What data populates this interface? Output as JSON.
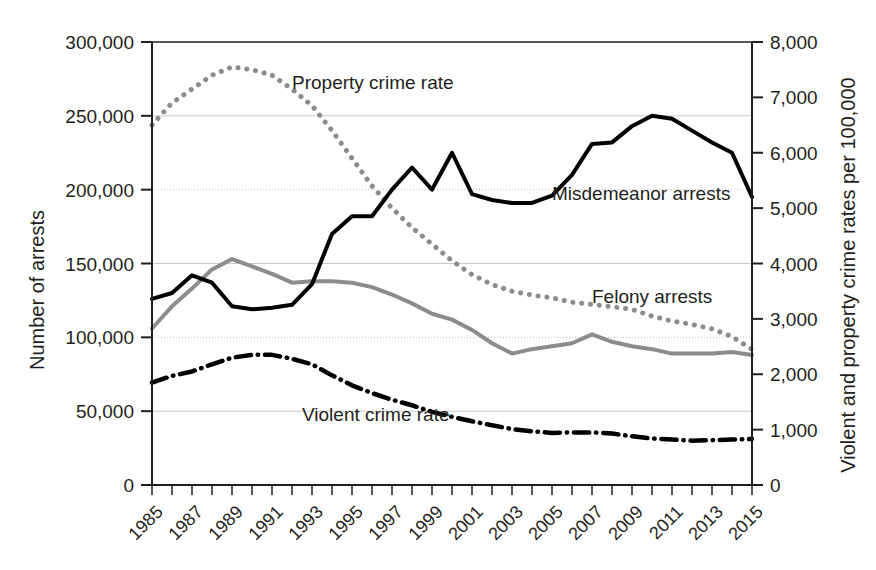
{
  "chart_data": {
    "type": "line",
    "title": "",
    "xlabel": "",
    "ylabel": "Number of arrests",
    "y2label": "Violent and property crime rates per 100,000",
    "grid": "horizontal-dotted",
    "legend": "inline-annotations",
    "x": [
      1985,
      1986,
      1987,
      1988,
      1989,
      1990,
      1991,
      1992,
      1993,
      1994,
      1995,
      1996,
      1997,
      1998,
      1999,
      2000,
      2001,
      2002,
      2003,
      2004,
      2005,
      2006,
      2007,
      2008,
      2009,
      2010,
      2011,
      2012,
      2013,
      2014,
      2015
    ],
    "xtick_labels": [
      "1985",
      "1987",
      "1989",
      "1991",
      "1993",
      "1995",
      "1997",
      "1999",
      "2001",
      "2003",
      "2005",
      "2007",
      "2009",
      "2011",
      "2013",
      "2015"
    ],
    "xtick_values": [
      1985,
      1987,
      1989,
      1991,
      1993,
      1995,
      1997,
      1999,
      2001,
      2003,
      2005,
      2007,
      2009,
      2011,
      2013,
      2015
    ],
    "xlim": [
      1985,
      2015
    ],
    "ytick_labels": [
      "0",
      "50,000",
      "100,000",
      "150,000",
      "200,000",
      "250,000",
      "300,000"
    ],
    "ytick_values": [
      0,
      50000,
      100000,
      150000,
      200000,
      250000,
      300000
    ],
    "ylim": [
      0,
      300000
    ],
    "y2tick_labels": [
      "0",
      "1,000",
      "2,000",
      "3,000",
      "4,000",
      "5,000",
      "6,000",
      "7,000",
      "8,000"
    ],
    "y2tick_values": [
      0,
      1000,
      2000,
      3000,
      4000,
      5000,
      6000,
      7000,
      8000
    ],
    "y2lim": [
      0,
      8000
    ],
    "series": [
      {
        "name": "Misdemeanor arrests",
        "axis": "left",
        "style": "solid",
        "color": "#000000",
        "width": 4,
        "label_x": 2005.0,
        "label_y": 193000,
        "values": [
          126000,
          130000,
          142000,
          137000,
          121000,
          119000,
          120000,
          122000,
          136000,
          170000,
          182000,
          182000,
          200000,
          215000,
          200000,
          225000,
          197000,
          193000,
          191000,
          191000,
          196000,
          210000,
          231000,
          232000,
          243000,
          250000,
          248000,
          240000,
          232000,
          225000,
          195000
        ]
      },
      {
        "name": "Felony arrests",
        "axis": "left",
        "style": "solid",
        "color": "#8c8c8c",
        "width": 4,
        "label_x": 2007.0,
        "label_y": 123000,
        "values": [
          106000,
          121000,
          133000,
          146000,
          153000,
          148000,
          143000,
          137000,
          138000,
          138000,
          137000,
          134000,
          129000,
          123000,
          116000,
          112000,
          105000,
          96000,
          89000,
          92000,
          94000,
          96000,
          102000,
          97000,
          94000,
          92000,
          89000,
          89000,
          89000,
          90000,
          88000
        ]
      },
      {
        "name": "Property crime rate",
        "axis": "right",
        "style": "dotted",
        "color": "#8c8c8c",
        "width": 5,
        "label_x": 1992.0,
        "label_y_right": 7150,
        "values": [
          6500,
          6900,
          7150,
          7400,
          7550,
          7500,
          7400,
          7150,
          6850,
          6400,
          5900,
          5400,
          5000,
          4650,
          4350,
          4050,
          3800,
          3620,
          3500,
          3430,
          3380,
          3300,
          3260,
          3220,
          3170,
          3050,
          2960,
          2900,
          2820,
          2680,
          2450
        ]
      },
      {
        "name": "Violent crime rate",
        "axis": "right",
        "style": "dashdot",
        "color": "#000000",
        "width": 4.5,
        "label_x": 1992.5,
        "label_y_right": 1150,
        "values": [
          1850,
          1970,
          2050,
          2180,
          2300,
          2350,
          2350,
          2280,
          2180,
          1980,
          1800,
          1660,
          1540,
          1440,
          1320,
          1230,
          1150,
          1080,
          1010,
          970,
          940,
          950,
          950,
          930,
          880,
          840,
          820,
          800,
          810,
          820,
          830
        ]
      }
    ]
  },
  "axis": {
    "left_title": "Number of arrests",
    "right_title": "Violent and property crime rates per 100,000"
  }
}
